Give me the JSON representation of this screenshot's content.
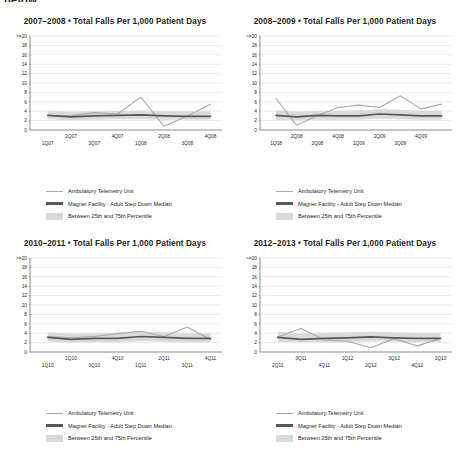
{
  "page": {
    "cut_top_text": "below..."
  },
  "legend": {
    "items": [
      {
        "label": "Ambulatory Telemetry Unit",
        "style": "thin-line",
        "color": "#a9a9a9"
      },
      {
        "label": "Magnet Facility - Adult Step Down Median",
        "style": "thick-line",
        "color": "#58595b"
      },
      {
        "label": "Between 25th and 75th Percentile",
        "style": "band",
        "color": "#d8d8d8"
      }
    ]
  },
  "axis": {
    "y_ticks": [
      ">=20",
      "18",
      "16",
      "14",
      "12",
      "10",
      "8",
      "6",
      "4",
      "2",
      "0"
    ],
    "ylim": [
      0,
      20
    ],
    "ylabel": "",
    "xlabel": ""
  },
  "chart_data": [
    {
      "type": "line",
      "title": "2007–2008  •  Total Falls Per 1,000 Patient Days",
      "categories": [
        "1Q07",
        "2Q07",
        "3Q07",
        "4Q07",
        "1Q08",
        "2Q08",
        "3Q08",
        "4Q08"
      ],
      "xlabel": "",
      "ylabel": "",
      "ylim": [
        0,
        20
      ],
      "yticks": [
        0,
        2,
        4,
        6,
        8,
        10,
        12,
        14,
        16,
        18,
        20
      ],
      "ytick_labels": [
        "0",
        "2",
        "4",
        "6",
        "8",
        "10",
        "12",
        "14",
        "16",
        "18",
        ">=20"
      ],
      "grid": true,
      "legend_position": "bottom",
      "series": [
        {
          "name": "Ambulatory Telemetry Unit",
          "color": "#a9a9a9",
          "values": [
            3.1,
            3.0,
            3.7,
            3.4,
            7.0,
            0.8,
            3.0,
            5.5
          ]
        },
        {
          "name": "Magnet Facility - Adult Step Down Median",
          "color": "#58595b",
          "values": [
            3.1,
            2.8,
            3.0,
            3.1,
            3.2,
            3.0,
            2.9,
            2.9
          ]
        }
      ],
      "band": {
        "name": "Between 25th and 75th Percentile",
        "color": "#d8d8d8",
        "lower": [
          2.3,
          2.1,
          2.2,
          2.3,
          2.3,
          2.2,
          2.2,
          2.2
        ],
        "upper": [
          4.1,
          3.9,
          4.0,
          4.1,
          4.1,
          4.0,
          4.0,
          4.0
        ]
      }
    },
    {
      "type": "line",
      "title": "2008–2009  •  Total Falls Per 1,000 Patient Days",
      "categories": [
        "1Q08",
        "2Q08",
        "3Q08",
        "4Q08",
        "1Q09",
        "2Q09",
        "3Q09",
        "4Q09"
      ],
      "xlabel": "",
      "ylabel": "",
      "ylim": [
        0,
        20
      ],
      "yticks": [
        0,
        2,
        4,
        6,
        8,
        10,
        12,
        14,
        16,
        18,
        20
      ],
      "ytick_labels": [
        "0",
        "2",
        "4",
        "6",
        "8",
        "10",
        "12",
        "14",
        "16",
        "18",
        ">=20"
      ],
      "grid": true,
      "legend_position": "bottom",
      "series": [
        {
          "name": "Ambulatory Telemetry Unit",
          "color": "#a9a9a9",
          "values": [
            6.7,
            1.0,
            3.1,
            4.8,
            5.3,
            4.8,
            7.3,
            4.5,
            5.5
          ]
        },
        {
          "name": "Magnet Facility - Adult Step Down Median",
          "color": "#58595b",
          "values": [
            3.1,
            2.8,
            3.1,
            3.0,
            3.0,
            3.4,
            3.2,
            3.0,
            3.0
          ]
        }
      ],
      "band": {
        "name": "Between 25th and 75th Percentile",
        "color": "#d8d8d8",
        "lower": [
          2.2,
          2.0,
          2.2,
          2.2,
          2.2,
          2.4,
          2.3,
          2.2,
          2.2
        ],
        "upper": [
          4.2,
          3.9,
          4.1,
          4.1,
          4.2,
          4.4,
          4.3,
          4.1,
          4.1
        ]
      }
    },
    {
      "type": "line",
      "title": "2010–2011  •  Total Falls Per 1,000 Patient Days",
      "categories": [
        "1Q10",
        "2Q10",
        "3Q10",
        "4Q10",
        "1Q11",
        "2Q11",
        "3Q11",
        "4Q11"
      ],
      "xlabel": "",
      "ylabel": "",
      "ylim": [
        0,
        20
      ],
      "yticks": [
        0,
        2,
        4,
        6,
        8,
        10,
        12,
        14,
        16,
        18,
        20
      ],
      "ytick_labels": [
        "0",
        "2",
        "4",
        "6",
        "8",
        "10",
        "12",
        "14",
        "16",
        "18",
        ">=20"
      ],
      "grid": true,
      "legend_position": "bottom",
      "series": [
        {
          "name": "Ambulatory Telemetry Unit",
          "color": "#a9a9a9",
          "values": [
            3.3,
            3.0,
            3.3,
            3.9,
            4.4,
            3.3,
            5.3,
            2.6
          ]
        },
        {
          "name": "Magnet Facility - Adult Step Down Median",
          "color": "#58595b",
          "values": [
            3.1,
            2.7,
            2.9,
            2.9,
            3.3,
            3.1,
            2.9,
            2.9
          ]
        }
      ],
      "band": {
        "name": "Between 25th and 75th Percentile",
        "color": "#d8d8d8",
        "lower": [
          2.2,
          2.0,
          2.1,
          2.1,
          2.3,
          2.2,
          2.1,
          2.1
        ],
        "upper": [
          4.2,
          3.9,
          4.0,
          4.1,
          4.3,
          4.2,
          4.0,
          4.0
        ]
      }
    },
    {
      "type": "line",
      "title": "2012–2013  •  Total Falls Per 1,000 Patient Days",
      "categories": [
        "2Q11",
        "3Q11",
        "4Q11",
        "1Q12",
        "2Q12",
        "3Q12",
        "4Q12",
        "1Q13"
      ],
      "xlabel": "",
      "ylabel": "",
      "ylim": [
        0,
        20
      ],
      "yticks": [
        0,
        2,
        4,
        6,
        8,
        10,
        12,
        14,
        16,
        18,
        20
      ],
      "ytick_labels": [
        "0",
        "2",
        "4",
        "6",
        "8",
        "10",
        "12",
        "14",
        "16",
        "18",
        ">=20"
      ],
      "grid": true,
      "legend_position": "bottom",
      "series": [
        {
          "name": "Ambulatory Telemetry Unit",
          "color": "#a9a9a9",
          "values": [
            3.2,
            5.0,
            2.6,
            2.3,
            0.9,
            2.8,
            1.3,
            2.9
          ]
        },
        {
          "name": "Magnet Facility - Adult Step Down Median",
          "color": "#58595b",
          "values": [
            3.1,
            2.7,
            2.9,
            3.0,
            3.2,
            3.0,
            2.9,
            2.9
          ]
        }
      ],
      "band": {
        "name": "Between 25th and 75th Percentile",
        "color": "#d8d8d8",
        "lower": [
          2.2,
          2.0,
          2.1,
          2.1,
          2.3,
          2.2,
          2.1,
          2.1
        ],
        "upper": [
          4.3,
          4.0,
          4.1,
          4.2,
          4.3,
          4.2,
          4.1,
          4.1
        ]
      }
    }
  ]
}
